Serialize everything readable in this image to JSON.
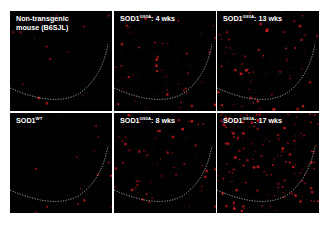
{
  "figure": {
    "panels": [
      {
        "id": "p1",
        "label_main": "Non-transgenic",
        "label_line2": "mouse (B6SJL)",
        "label_sup": "",
        "label_suffix": "",
        "density": 14,
        "seed": 11
      },
      {
        "id": "p2",
        "label_main": "SOD1",
        "label_sup": "G93A",
        "label_suffix": ": 4 wks",
        "label_line2": "",
        "density": 55,
        "seed": 23
      },
      {
        "id": "p3",
        "label_main": "SOD1",
        "label_sup": "G93A",
        "label_suffix": ": 13 wks",
        "label_line2": "",
        "density": 70,
        "seed": 37
      },
      {
        "id": "p4",
        "label_main": "SOD1",
        "label_sup": "WT",
        "label_suffix": "",
        "label_line2": "",
        "density": 16,
        "seed": 41
      },
      {
        "id": "p5",
        "label_main": "SOD1",
        "label_sup": "G93A",
        "label_suffix": ": 8 wks",
        "label_line2": "",
        "density": 60,
        "seed": 53
      },
      {
        "id": "p6",
        "label_main": "SOD1",
        "label_sup": "G93A",
        "label_suffix": ": 17 wks",
        "label_line2": "",
        "density": 150,
        "seed": 67
      }
    ],
    "colors": {
      "background": "#000000",
      "signal": "#e02020",
      "boundary": "#e8e8e8",
      "label": "#ffffff"
    }
  }
}
